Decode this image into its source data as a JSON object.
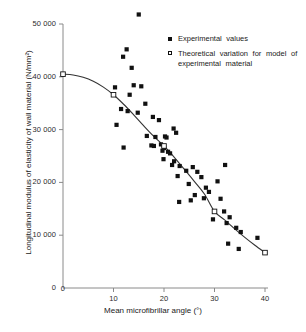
{
  "chart_data": {
    "type": "scatter",
    "title": "",
    "xlabel": "Mean microfibrillar angle (°)",
    "ylabel": "Longitudinal modulus of elasticity of wall material (N/mm²)",
    "xlim": [
      0,
      42
    ],
    "ylim": [
      0,
      53000
    ],
    "grid": false,
    "legend_position": "top-right",
    "xticks": [
      0,
      10,
      20,
      30,
      40
    ],
    "xtick_labels": [
      "0",
      "10",
      "20",
      "30",
      "40"
    ],
    "yticks": [
      0,
      10000,
      20000,
      30000,
      40000,
      50000
    ],
    "ytick_labels": [
      "0",
      "10 000",
      "20 000",
      "30 000",
      "40 000",
      "50 000"
    ],
    "series": [
      {
        "name": "Experimental values",
        "marker": "filled-square",
        "points": [
          [
            15.0,
            51800
          ],
          [
            12.6,
            45200
          ],
          [
            11.9,
            43800
          ],
          [
            13.6,
            41700
          ],
          [
            10.3,
            38000
          ],
          [
            14.0,
            38400
          ],
          [
            15.5,
            38200
          ],
          [
            13.2,
            36600
          ],
          [
            16.3,
            34900
          ],
          [
            11.5,
            33900
          ],
          [
            12.8,
            33500
          ],
          [
            14.8,
            33200
          ],
          [
            17.8,
            32400
          ],
          [
            10.6,
            30900
          ],
          [
            19.0,
            31800
          ],
          [
            21.9,
            30200
          ],
          [
            22.4,
            29400
          ],
          [
            16.6,
            28800
          ],
          [
            18.3,
            28600
          ],
          [
            20.2,
            28700
          ],
          [
            20.5,
            28500
          ],
          [
            12.0,
            26600
          ],
          [
            17.5,
            27000
          ],
          [
            18.0,
            26900
          ],
          [
            19.4,
            27200
          ],
          [
            20.0,
            26500
          ],
          [
            19.7,
            26000
          ],
          [
            20.8,
            25800
          ],
          [
            21.2,
            25500
          ],
          [
            19.9,
            24400
          ],
          [
            22.0,
            24000
          ],
          [
            21.6,
            23300
          ],
          [
            23.1,
            23100
          ],
          [
            25.7,
            22900
          ],
          [
            32.1,
            23300
          ],
          [
            24.4,
            22200
          ],
          [
            26.6,
            22000
          ],
          [
            22.7,
            21200
          ],
          [
            27.4,
            21000
          ],
          [
            30.6,
            20200
          ],
          [
            24.9,
            19700
          ],
          [
            28.3,
            19000
          ],
          [
            28.9,
            18200
          ],
          [
            26.1,
            17600
          ],
          [
            27.9,
            17000
          ],
          [
            31.2,
            16900
          ],
          [
            25.3,
            16600
          ],
          [
            23.0,
            16300
          ],
          [
            31.9,
            14500
          ],
          [
            33.0,
            13400
          ],
          [
            29.7,
            13000
          ],
          [
            32.4,
            12300
          ],
          [
            34.3,
            11400
          ],
          [
            35.2,
            10600
          ],
          [
            38.5,
            9500
          ],
          [
            32.7,
            8400
          ],
          [
            34.8,
            7400
          ]
        ]
      },
      {
        "name": "Theoretical variation for model of experimental material",
        "marker": "open-square",
        "points": [
          [
            0.0,
            40500
          ],
          [
            10.0,
            36600
          ],
          [
            20.0,
            26900
          ],
          [
            30.0,
            14500
          ],
          [
            40.0,
            6700
          ]
        ]
      }
    ],
    "curve": {
      "name": "theoretical-curve",
      "points": [
        [
          0.0,
          40500
        ],
        [
          2.0,
          40350
        ],
        [
          4.0,
          39900
        ],
        [
          6.0,
          39150
        ],
        [
          8.0,
          38050
        ],
        [
          10.0,
          36600
        ],
        [
          12.0,
          34800
        ],
        [
          14.0,
          32800
        ],
        [
          16.0,
          30700
        ],
        [
          18.0,
          28700
        ],
        [
          20.0,
          26900
        ],
        [
          22.0,
          24800
        ],
        [
          24.0,
          22500
        ],
        [
          26.0,
          20200
        ],
        [
          28.0,
          17800
        ],
        [
          30.0,
          14500
        ],
        [
          32.0,
          12900
        ],
        [
          34.0,
          11200
        ],
        [
          36.0,
          9600
        ],
        [
          38.0,
          8100
        ],
        [
          40.0,
          6700
        ]
      ]
    }
  },
  "legend": {
    "entries": [
      {
        "label": "Experimental   values",
        "marker": "filled-square"
      },
      {
        "label": "Theoretical variation for model of experimental material",
        "marker": "open-square"
      }
    ]
  },
  "colors": {
    "axis": "#8a8a8a",
    "marker": "#111111",
    "curve": "#333333",
    "text": "#1a1a1a"
  }
}
